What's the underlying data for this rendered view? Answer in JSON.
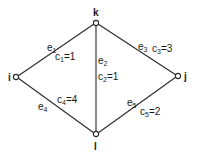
{
  "graph": {
    "colors": {
      "line": "#2a2a2a",
      "node_fill": "#ffffff",
      "text": "#1a1a1a",
      "background": "#ffffff"
    },
    "nodes": [
      {
        "id": "k",
        "label": "k"
      },
      {
        "id": "i",
        "label": "i"
      },
      {
        "id": "j",
        "label": "j"
      },
      {
        "id": "l",
        "label": "l"
      }
    ],
    "edges": [
      {
        "id": "e1",
        "name": "e",
        "name_sub": "1",
        "cost_name": "c",
        "cost_sub": "1",
        "cost_value": "=1",
        "from": "i",
        "to": "k"
      },
      {
        "id": "e2",
        "name": "e",
        "name_sub": "2",
        "cost_name": "c",
        "cost_sub": "2",
        "cost_value": "=1",
        "from": "k",
        "to": "l"
      },
      {
        "id": "e3",
        "name": "e",
        "name_sub": "3",
        "cost_name": "c",
        "cost_sub": "3",
        "cost_value": "=3",
        "from": "k",
        "to": "j"
      },
      {
        "id": "e4",
        "name": "e",
        "name_sub": "4",
        "cost_name": "c",
        "cost_sub": "4",
        "cost_value": "=4",
        "from": "i",
        "to": "l"
      },
      {
        "id": "e5",
        "name": "e",
        "name_sub": "5",
        "cost_name": "c",
        "cost_sub": "5",
        "cost_value": "=2",
        "from": "l",
        "to": "j"
      }
    ]
  }
}
